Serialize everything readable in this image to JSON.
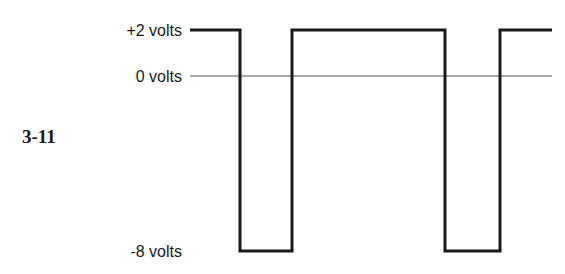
{
  "figure": {
    "label": "3-11",
    "levels": [
      {
        "label": "+2 volts",
        "value": 2,
        "y": 30
      },
      {
        "label": "0 volts",
        "value": 0,
        "y": 76
      },
      {
        "label": "-8 volts",
        "value": -8,
        "y": 251
      }
    ],
    "waveform": {
      "type": "square-wave",
      "high_level": "+2 volts",
      "low_level": "-8 volts",
      "transitions_x": [
        190,
        240,
        292,
        445,
        500,
        552
      ],
      "color": "#1a1a1a",
      "reference_line_color": "#555555"
    }
  }
}
